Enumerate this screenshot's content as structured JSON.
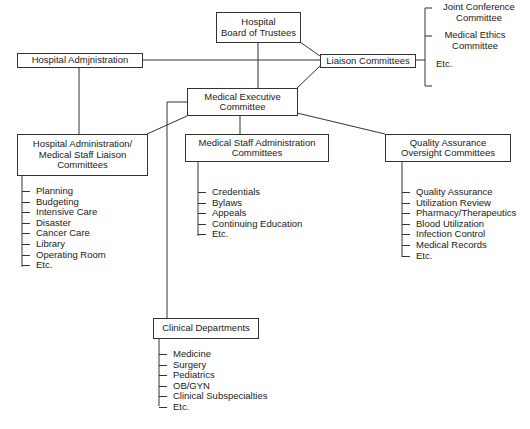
{
  "diagram": {
    "nodes": {
      "board": {
        "lines": [
          "Hospital",
          "Board of Trustees"
        ]
      },
      "hospital_admin": {
        "lines": [
          "Hospital Admjnistration"
        ]
      },
      "liaison": {
        "lines": [
          "Liaison Committees"
        ]
      },
      "med_exec": {
        "lines": [
          "Medical Executive",
          "Committee"
        ]
      },
      "ha_ms_liaison": {
        "lines": [
          "Hospital Administration/",
          "Medical Staff Liaison",
          "Committees"
        ]
      },
      "msa": {
        "lines": [
          "Medical Staff Administration",
          "Committees"
        ]
      },
      "qa": {
        "lines": [
          "Quality Assurance",
          "Oversight Committees"
        ]
      },
      "clinical": {
        "lines": [
          "Clinical Departments"
        ]
      }
    },
    "lists": {
      "liaison_children": [
        "Joint Conference     Committee",
        "Medical Ethics     Committee",
        "Etc."
      ],
      "liaison_children_lines": [
        [
          "Joint Conference",
          "Committee"
        ],
        [
          "Medical Ethics",
          "Committee"
        ],
        [
          "Etc."
        ]
      ],
      "ha_ms_items": [
        "Planning",
        "Budgeting",
        "Intensive Care",
        "Disaster",
        "Cancer Care",
        "Library",
        "Operating Room",
        "Etc."
      ],
      "msa_items": [
        "Credentials",
        "Bylaws",
        "Appeals",
        "Continuing Education",
        "Etc."
      ],
      "qa_items": [
        "Quality Assurance",
        "Utilization Review",
        "Pharmacy/Therapeutics",
        "Blood Utilization",
        "Infection Control",
        "Medical Records",
        "Etc."
      ],
      "clinical_items": [
        "Medicine",
        "Surgery",
        "Pediatrics",
        "OB/GYN",
        "Clinical Subspecialties",
        "Etc."
      ]
    }
  }
}
